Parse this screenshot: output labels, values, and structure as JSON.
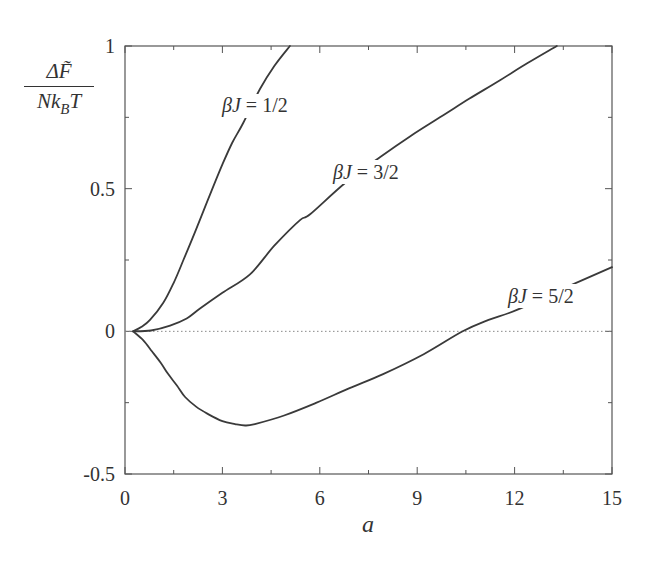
{
  "chart_data": {
    "type": "line",
    "title": "",
    "xlabel": "a",
    "ylabel": "ΔF̃ / (N k_B T)",
    "ylabel_parts": {
      "numerator": "ΔF̃",
      "denominator_main": "Nk",
      "denominator_sub": "B",
      "denominator_tail": "T"
    },
    "xlim": [
      0,
      15
    ],
    "ylim": [
      -0.5,
      1
    ],
    "x_ticks_major": [
      0,
      3,
      6,
      9,
      12,
      15
    ],
    "x_tick_labels": [
      "0",
      "3",
      "6",
      "9",
      "12",
      "15"
    ],
    "x_ticks_minor": [
      1.5,
      4.5,
      7.5,
      10.5,
      13.5
    ],
    "y_ticks_major": [
      -0.5,
      0,
      0.5,
      1
    ],
    "y_tick_labels": [
      "-0.5",
      "0",
      "0.5",
      "1"
    ],
    "y_ticks_minor": [
      -0.25,
      0.25,
      0.75
    ],
    "grid": false,
    "reference_line": {
      "y": 0,
      "style": "dotted"
    },
    "legend": "inline labels",
    "series": [
      {
        "name": "βJ = 1/2",
        "label": "βJ = 1/2",
        "x": [
          0.25,
          0.5,
          0.77,
          1.18,
          1.5,
          1.8,
          2.2,
          2.62,
          3.0,
          3.3,
          3.64,
          4.16,
          4.6,
          5.08
        ],
        "y": [
          0.0,
          0.015,
          0.04,
          0.1,
          0.17,
          0.25,
          0.36,
          0.48,
          0.585,
          0.66,
          0.73,
          0.85,
          0.93,
          1.0
        ]
      },
      {
        "name": "βJ = 3/2",
        "label": "βJ = 3/2",
        "x": [
          0.25,
          0.8,
          1.39,
          1.9,
          2.31,
          3.0,
          3.85,
          4.6,
          5.39,
          5.7,
          6.78,
          7.85,
          8.8,
          9.7,
          10.6,
          11.55,
          12.4,
          13.3
        ],
        "y": [
          0.0,
          0.003,
          0.02,
          0.045,
          0.08,
          0.135,
          0.2,
          0.3,
          0.39,
          0.41,
          0.52,
          0.61,
          0.685,
          0.75,
          0.815,
          0.88,
          0.94,
          1.0
        ]
      },
      {
        "name": "βJ = 5/2",
        "label": "βJ = 5/2",
        "x": [
          0.25,
          0.55,
          0.83,
          1.1,
          1.33,
          1.6,
          1.85,
          2.2,
          2.56,
          3.0,
          3.39,
          3.7,
          4.0,
          4.9,
          5.9,
          6.9,
          7.95,
          9.2,
          10.4,
          11.2,
          12.07,
          13.5,
          15.0
        ],
        "y": [
          0.0,
          -0.03,
          -0.07,
          -0.11,
          -0.15,
          -0.19,
          -0.23,
          -0.265,
          -0.29,
          -0.315,
          -0.325,
          -0.33,
          -0.325,
          -0.295,
          -0.25,
          -0.2,
          -0.15,
          -0.08,
          0.0,
          0.04,
          0.075,
          0.15,
          0.225
        ]
      }
    ]
  },
  "labels": {
    "x_axis": "a",
    "curve_1": "βJ = 1/2",
    "curve_2": "βJ = 3/2",
    "curve_3": "βJ = 5/2",
    "ylabel_num": "ΔF̃",
    "ylabel_den_main": "Nk",
    "ylabel_den_sub": "B",
    "ylabel_den_tail": "T"
  },
  "colors": {
    "curve": "#3a3a3a",
    "axis": "#555555",
    "text": "#333333",
    "background": "#ffffff"
  }
}
